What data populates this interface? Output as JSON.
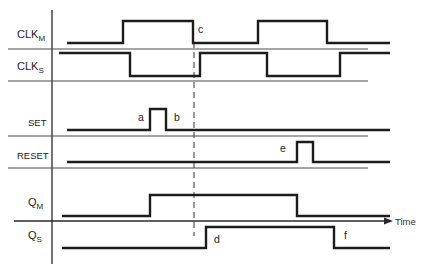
{
  "signals": [
    {
      "id": "clk_m",
      "label": "CLK",
      "subscript": "M",
      "initial": 0,
      "transitions": [
        123,
        193,
        258,
        327
      ],
      "end": 390
    },
    {
      "id": "clk_s",
      "label": "CLK",
      "subscript": "S",
      "initial": 1,
      "transitions": [
        130,
        200,
        267,
        340
      ],
      "end": 390
    },
    {
      "id": "set",
      "label": "SET",
      "subscript": "",
      "initial": 0,
      "transitions": [
        150,
        166
      ],
      "end": 390
    },
    {
      "id": "reset",
      "label": "RESET",
      "subscript": "",
      "initial": 0,
      "transitions": [
        297,
        313
      ],
      "end": 390
    },
    {
      "id": "q_m",
      "label": "Q",
      "subscript": "M",
      "initial": 0,
      "transitions": [
        150,
        297
      ],
      "end": 390
    },
    {
      "id": "q_s",
      "label": "Q",
      "subscript": "S",
      "initial": 0,
      "transitions": [
        206,
        334
      ],
      "end": 390
    }
  ],
  "events": [
    {
      "id": "a",
      "label": "a"
    },
    {
      "id": "b",
      "label": "b"
    },
    {
      "id": "c",
      "label": "c"
    },
    {
      "id": "d",
      "label": "d"
    },
    {
      "id": "e",
      "label": "e"
    },
    {
      "id": "f",
      "label": "f"
    }
  ],
  "axis": {
    "time_label": "Time"
  }
}
